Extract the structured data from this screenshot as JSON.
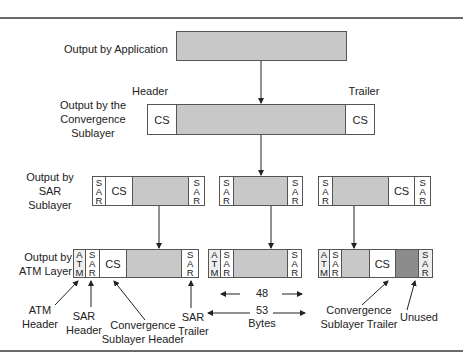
{
  "rows": {
    "application": {
      "label": "Output by Application"
    },
    "convergence": {
      "label_lines": [
        "Output by the",
        "Convergence",
        "Sublayer"
      ],
      "header_label": "Header",
      "trailer_label": "Trailer",
      "cs": "CS"
    },
    "sar": {
      "label_lines": [
        "Output by",
        "SAR",
        "Sublayer"
      ]
    },
    "atm": {
      "label_lines": [
        "Output by",
        "ATM Layer"
      ]
    }
  },
  "cell_text": {
    "cs": "CS",
    "sar_letters": [
      "S",
      "A",
      "R"
    ],
    "atm_letters": [
      "A",
      "T",
      "M"
    ]
  },
  "annotations": {
    "atm_header": [
      "ATM",
      "Header"
    ],
    "sar_header": [
      "SAR",
      "Header"
    ],
    "cs_header": [
      "Convergence",
      "Sublayer Header"
    ],
    "sar_trailer": [
      "SAR",
      "Trailer"
    ],
    "cs_trailer": [
      "Convergence",
      "Sublayer Trailer"
    ],
    "unused": "Unused"
  },
  "dimensions": {
    "payload_bytes": "48",
    "cell_bytes": "53",
    "bytes_label": "Bytes"
  },
  "colors": {
    "payload": "#c8c8c8",
    "unused": "#8c8c8c",
    "border": "#555555",
    "rule": "#6a6a6a"
  }
}
